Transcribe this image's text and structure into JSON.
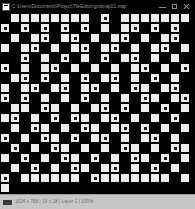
{
  "window": {
    "title": "C:\\Users\\Documents\\Project\\TileEditor\\gridmap01.map",
    "icon": "application-icon"
  },
  "titlebar": {
    "minimize_label": "Minimize",
    "maximize_label": "Maximize",
    "close_label": "Close"
  },
  "footer": {
    "status_text": "1024 x 768  |  19 x 18  |  Layer 1  |  100%",
    "right_text": ""
  },
  "chart_data": {
    "type": "heatmap",
    "title": "",
    "xlabel": "",
    "ylabel": "",
    "cols": 19,
    "rows": 18,
    "cell_px": 10,
    "legend": [],
    "palette": {
      "background": "#000000",
      "filled": "#f2f2f2",
      "dim": "#cfcfcf",
      "dot": "#111111"
    },
    "cell_codes": [
      "0 1 1 1 1 1 1 1 1 0 3 0 1 1 1 1 1 1 1",
      "3 0 3 0 3 0 3 0 3 0 1 0 1 3 0 3 0 3 0",
      "0 1 0 1 3 0 1 3 0 1 0 1 3 0 1 0 1 3 0",
      "1 0 1 3 0 1 0 1 3 0 1 3 0 1 0 1 3 0 1",
      "0 0 3 0 1 0 3 0 1 0 3 0 1 3 0 1 0 1 0",
      "3 0 1 0 1 3 0 1 0 1 0 1 0 1 3 0 1 0 3",
      "0 1 3 0 3 0 1 0 3 0 1 3 0 1 0 3 0 1 0",
      "1 0 1 3 0 1 3 0 1 3 0 1 0 3 1 0 1 3 0",
      "3 0 3 0 1 0 1 0 3 0 1 0 1 0 3 1 0 1 3",
      "0 1 1 0 3 1 0 1 0 1 3 0 3 0 1 0 3 0 1",
      "1 3 0 1 0 3 0 3 1 0 1 3 0 1 0 1 0 3 0",
      "0 1 0 3 1 0 1 0 3 1 0 1 3 0 3 0 1 0 1",
      "3 0 1 0 3 1 0 3 0 1 3 0 1 0 1 3 0 1 0",
      "0 3 0 1 0 3 1 0 1 0 1 0 3 1 0 1 0 3 1",
      "1 0 3 0 1 0 3 1 0 3 0 1 0 3 1 0 3 0 1",
      "0 1 0 3 0 1 0 3 1 0 1 3 0 1 0 3 0 1 0",
      "3 0 1 1 1 1 1 1 0 3 1 1 1 1 1 1 1 0 1",
      "1 0 0 0 0 0 0 0 0 0 0 0 0 0 0 0 0 0 0"
    ]
  }
}
